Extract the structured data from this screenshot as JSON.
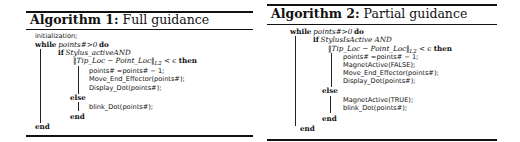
{
  "algorithm1": {
    "label": "Algorithm 1:",
    "name": "Full guidance",
    "lines": {
      "init": "initialization;",
      "while_kw": "while",
      "while_cond": "points#>0",
      "do_kw": "do",
      "if_kw": "if",
      "if_cond": "Stylus_activeAND",
      "norm_left": "‖Tip_Loc − Point_Loc‖",
      "norm_sub": "L2",
      "norm_rel": " < ϵ ",
      "then_kw": "then",
      "stmt1": "points# =points# − 1;",
      "stmt2": "Move_End_Effector(points#);",
      "stmt3": "Display_Dot(points#);",
      "else_kw": "else",
      "stmt4": "blink_Dot(points#);",
      "end_if": "end",
      "end_while": "end"
    }
  },
  "algorithm2": {
    "label": "Algorithm 2:",
    "name": "Partial guidance",
    "lines": {
      "while_kw": "while",
      "while_cond": "points#>0",
      "do_kw": "do",
      "if_kw": "if",
      "if_cond": "StylusIsActive AND",
      "norm_left": "‖Tip_Loc − Point_Loc‖",
      "norm_sub": "L2",
      "norm_rel": " < ϵ ",
      "then_kw": "then",
      "stmt1": "points# =points# − 1;",
      "stmt2": "MagnetActive(FALSE);",
      "stmt3": "Move_End_Effector(points#);",
      "stmt4": "Display_Dot(points#);",
      "else_kw": "else",
      "stmt5": "MagnetActive(TRUE);",
      "stmt6": "blink_Dot(points#);",
      "end_if": "end",
      "end_while": "end"
    }
  }
}
